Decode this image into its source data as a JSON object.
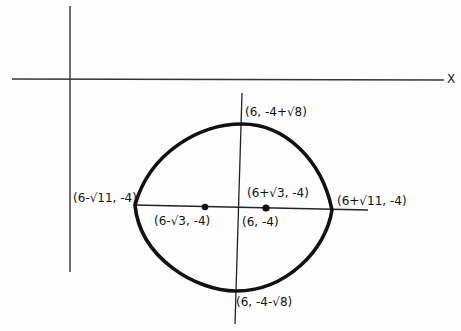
{
  "diagram": {
    "type": "ellipse-graph",
    "axes": {
      "x_label": "X"
    },
    "colors": {
      "ink": "#111111",
      "axis": "#333333",
      "background": "#fdfdfd"
    },
    "labels": {
      "top_vertex": "(6, -4+√8)",
      "bottom_vertex": "(6, -4-√8)",
      "left_vertex": "(6-√11, -4)",
      "right_vertex": "(6+√11, -4)",
      "left_focus": "(6-√3, -4)",
      "right_focus": "(6+√3, -4)",
      "center": "(6, -4)"
    }
  }
}
